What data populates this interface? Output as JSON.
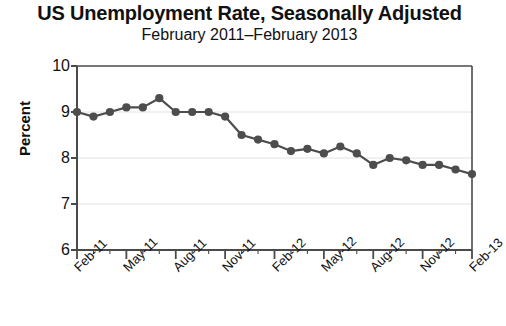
{
  "chart_data": {
    "type": "line",
    "title": "US Unemployment Rate, Seasonally Adjusted",
    "subtitle": "February 2011–February 2013",
    "xlabel": "",
    "ylabel": "Percent",
    "ylim": [
      6,
      10
    ],
    "ytick_labels": [
      "10",
      "9",
      "8",
      "7",
      "6"
    ],
    "ytick_values": [
      10,
      9,
      8,
      7,
      6
    ],
    "grid": true,
    "grid_axis": "y",
    "legend": false,
    "marker": "circle",
    "series_color": "#4d4d4d",
    "x": [
      "Feb-11",
      "Mar-11",
      "Apr-11",
      "May-11",
      "Jun-11",
      "Jul-11",
      "Aug-11",
      "Sep-11",
      "Oct-11",
      "Nov-11",
      "Dec-11",
      "Jan-12",
      "Feb-12",
      "Mar-12",
      "Apr-12",
      "May-12",
      "Jun-12",
      "Jul-12",
      "Aug-12",
      "Sep-12",
      "Oct-12",
      "Nov-12",
      "Dec-12",
      "Jan-13",
      "Feb-13"
    ],
    "values": [
      9.0,
      8.9,
      9.0,
      9.1,
      9.1,
      9.3,
      9.0,
      9.0,
      9.0,
      8.9,
      8.5,
      8.4,
      8.3,
      8.15,
      8.2,
      8.1,
      8.25,
      8.1,
      7.85,
      8.0,
      7.95,
      7.85,
      7.85,
      7.75,
      7.65
    ],
    "xtick_labels": [
      "Feb-11",
      "May-11",
      "Aug-11",
      "Nov-11",
      "Feb-12",
      "May-12",
      "Aug-12",
      "Nov-12",
      "Feb-13"
    ],
    "xtick_indices": [
      0,
      3,
      6,
      9,
      12,
      15,
      18,
      21,
      24
    ]
  }
}
